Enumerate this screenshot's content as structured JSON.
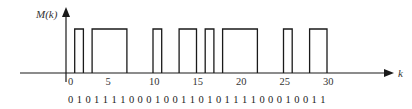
{
  "diagram": {
    "y_axis_label": "M(k)",
    "x_axis_label": "k",
    "tick_labels": [
      "0",
      "5",
      "10",
      "15",
      "20",
      "25",
      "30"
    ],
    "ticks": [
      0,
      5,
      10,
      15,
      20,
      25,
      30
    ],
    "bit_sequence_text": "0 10111100010011010111100010011",
    "bits": [
      0,
      1,
      0,
      1,
      1,
      1,
      1,
      0,
      0,
      0,
      1,
      0,
      0,
      1,
      1,
      0,
      1,
      0,
      1,
      1,
      1,
      1,
      0,
      0,
      0,
      1,
      0,
      0,
      1,
      1
    ],
    "pulses_k_ranges": [
      [
        1,
        2
      ],
      [
        3,
        7
      ],
      [
        10,
        11
      ],
      [
        13,
        15
      ],
      [
        16,
        17
      ],
      [
        18,
        22
      ],
      [
        25,
        26
      ],
      [
        28,
        30
      ]
    ],
    "line_color": "#1a1a1a"
  }
}
